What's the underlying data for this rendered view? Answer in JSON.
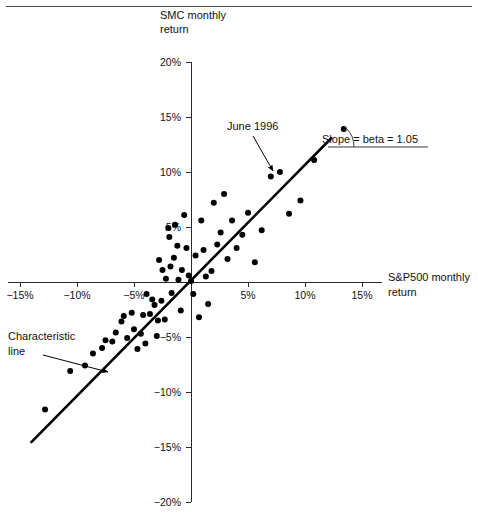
{
  "figure": {
    "title_top_rule": true
  },
  "chart_data": {
    "type": "scatter",
    "title": "",
    "xlabel": "S&P500 monthly return",
    "ylabel": "SMC monthly return",
    "xlabel_lines": [
      "S&P500 monthly",
      "return"
    ],
    "ylabel_lines": [
      "SMC monthly",
      "return"
    ],
    "xlim": [
      -17.5,
      16.5
    ],
    "ylim": [
      -20,
      20
    ],
    "grid": false,
    "legend": null,
    "xticks": [
      -15,
      -10,
      -5,
      5,
      10,
      15
    ],
    "xtick_labels": [
      "−15%",
      "−10%",
      "−5%",
      "5%",
      "10%",
      "15%"
    ],
    "yticks": [
      20,
      15,
      10,
      5,
      -5,
      -10,
      -15,
      -20
    ],
    "ytick_labels": [
      "20%",
      "15%",
      "10%",
      "5%",
      "−5%",
      "−10%",
      "−15%",
      "−20%"
    ],
    "x": [
      -12.8,
      -10.6,
      -9.3,
      -8.6,
      -7.8,
      -7.5,
      -6.9,
      -6.6,
      -6.1,
      -5.9,
      -5.6,
      -5.2,
      -5.0,
      -4.7,
      -4.4,
      -4.2,
      -4.0,
      -3.9,
      -3.6,
      -3.4,
      -3.2,
      -3.0,
      -2.9,
      -2.8,
      -2.6,
      -2.5,
      -2.3,
      -2.2,
      -2.0,
      -1.9,
      -1.8,
      -1.7,
      -1.5,
      -1.4,
      -1.2,
      -1.1,
      -0.9,
      -0.8,
      -0.6,
      -0.4,
      -0.2,
      0.0,
      0.2,
      0.4,
      0.7,
      0.9,
      1.1,
      1.3,
      1.5,
      1.8,
      2.0,
      2.3,
      2.6,
      2.9,
      3.2,
      3.6,
      4.0,
      4.5,
      5.0,
      5.6,
      6.2,
      7.0,
      7.8,
      8.6,
      9.6,
      10.8,
      13.4
    ],
    "y": [
      -11.6,
      -8.1,
      -7.6,
      -6.5,
      -6.0,
      -5.3,
      -5.4,
      -4.6,
      -3.6,
      -3.1,
      -5.1,
      -2.8,
      -4.3,
      -6.1,
      -4.7,
      -3.0,
      -5.6,
      -1.1,
      -2.9,
      -1.6,
      -2.1,
      -4.9,
      -3.5,
      2.0,
      -1.7,
      1.1,
      -3.4,
      0.3,
      4.9,
      4.1,
      1.4,
      -1.0,
      2.2,
      5.2,
      3.3,
      0.2,
      -2.6,
      1.1,
      6.1,
      3.1,
      0.6,
      0.1,
      -1.1,
      2.4,
      -3.2,
      5.6,
      2.9,
      0.5,
      -2.0,
      1.0,
      7.2,
      3.4,
      4.5,
      8.0,
      2.1,
      5.6,
      3.1,
      4.3,
      6.3,
      1.8,
      4.7,
      9.6,
      10.0,
      6.2,
      7.4,
      11.1,
      13.9
    ],
    "fit_line": {
      "label": "Characteristic line",
      "slope": 1.05,
      "intercept": 0.15,
      "x_start": -14.0,
      "x_end": 12.3
    },
    "annotations": [
      {
        "name": "june-1996",
        "text": "June 1996",
        "text_x": 227,
        "text_y": 130,
        "arrow_from_x": 253,
        "arrow_from_y": 136,
        "arrow_to_x": 273,
        "arrow_to_y": 171
      },
      {
        "name": "characteristic-line",
        "text_lines": [
          "Characteristic",
          "line"
        ],
        "text_x": 8,
        "text_y": 340,
        "arrow_from_x": 43,
        "arrow_from_y": 355,
        "arrow_to_x": 108,
        "arrow_to_y": 372
      },
      {
        "name": "slope-beta",
        "text": "Slope = beta = 1.05",
        "text_x": 370,
        "text_y": 143,
        "base_x1": 328,
        "base_x2": 428,
        "base_y": 147,
        "arc_label": "angle"
      }
    ]
  }
}
